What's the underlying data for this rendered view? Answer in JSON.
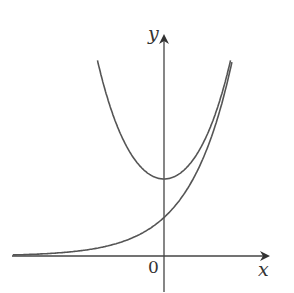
{
  "diagram": {
    "x_axis_label": "x",
    "y_axis_label": "y",
    "origin_label": "0",
    "curves": [
      {
        "name": "cosh-curve",
        "description": "y = cosh x, minimum at (0,1)"
      },
      {
        "name": "exponential-curve",
        "description": "y = (1/2)e^x, passes (0, 1/2)"
      }
    ],
    "line_color": "#555555"
  }
}
